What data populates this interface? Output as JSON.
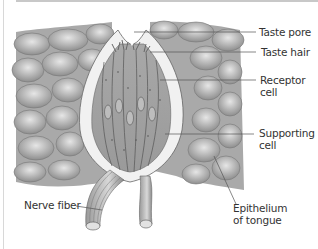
{
  "diagram": {
    "labels": {
      "taste_pore": "Taste pore",
      "taste_hair": "Taste hair",
      "receptor_cell_1": "Receptor",
      "receptor_cell_2": "cell",
      "supporting_cell_1": "Supporting",
      "supporting_cell_2": "cell",
      "epithelium_1": "Epithelium",
      "epithelium_2": "of tongue",
      "nerve_fiber": "Nerve fiber"
    },
    "colors": {
      "tissue_dark": "#8c8c8c",
      "tissue_mid": "#b4b4b4",
      "tissue_light": "#dcdcdc",
      "leader_line": "#555555",
      "frame": "#c8c8c8"
    }
  }
}
